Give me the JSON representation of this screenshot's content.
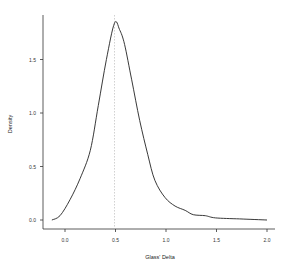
{
  "chart_data": {
    "type": "line",
    "title": "",
    "xlabel": "Glass' Delta",
    "ylabel": "Density",
    "xlim": [
      -0.15,
      2.05
    ],
    "ylim": [
      0,
      1.95
    ],
    "xticks": [
      0.0,
      0.5,
      1.0,
      1.5,
      2.0
    ],
    "xtick_labels": [
      "0.0",
      "0.5",
      "1.0",
      "1.5",
      "2.0"
    ],
    "yticks": [
      0.0,
      0.5,
      1.0,
      1.5
    ],
    "ytick_labels": [
      "0.0",
      "0.5",
      "1.0",
      "1.5"
    ],
    "grid": false,
    "legend": null,
    "annotations": [
      {
        "type": "vertical-line",
        "x": 0.49,
        "style": "dotted",
        "color": "#bbbbbb"
      }
    ],
    "series": [
      {
        "name": "density",
        "color": "#222222",
        "x": [
          -0.13,
          -0.05,
          0.05,
          0.15,
          0.25,
          0.33,
          0.41,
          0.49,
          0.54,
          0.59,
          0.66,
          0.74,
          0.82,
          0.89,
          0.99,
          1.09,
          1.19,
          1.27,
          1.39,
          1.49,
          1.73,
          2.0
        ],
        "y": [
          0.0,
          0.04,
          0.19,
          0.39,
          0.65,
          1.07,
          1.5,
          1.84,
          1.78,
          1.64,
          1.31,
          0.93,
          0.61,
          0.37,
          0.21,
          0.13,
          0.09,
          0.05,
          0.04,
          0.02,
          0.01,
          0.0
        ]
      }
    ]
  }
}
